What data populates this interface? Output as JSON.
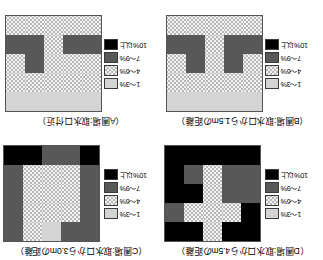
{
  "figure": {
    "orientation": "rotated-180",
    "rows": 5,
    "cols": 5
  },
  "legend": {
    "items": [
      {
        "label": "1〜3%",
        "category": "cat0",
        "swatch": "light-gray"
      },
      {
        "label": "4〜6%",
        "category": "cat1",
        "swatch": "checkered"
      },
      {
        "label": "7〜9%",
        "category": "cat2",
        "swatch": "dark-gray"
      },
      {
        "label": "10%以上",
        "category": "cat3",
        "swatch": "black"
      }
    ]
  },
  "panels": {
    "d": {
      "title": "（D圃場:取水口から4.5mの距離）",
      "id": "D"
    },
    "c": {
      "title": "（C圃場:取水口から3.0mの距離）",
      "id": "C"
    },
    "b": {
      "title": "（B圃場:取水口から1.5mの距離）",
      "id": "B"
    },
    "a": {
      "title": "（A圃場:取水口付近）",
      "id": "A"
    }
  },
  "chart_data": {
    "type": "heatmap",
    "xlabel": "",
    "ylabel": "",
    "grid": true,
    "legend_position": "left",
    "categories": [
      "1〜3%",
      "4〜6%",
      "7〜9%",
      "10%以上"
    ],
    "category_keys": [
      "cat0",
      "cat1",
      "cat2",
      "cat3"
    ],
    "colors": {
      "cat0": "#d4d4d4",
      "cat1": "#f2f2f2",
      "cat2": "#585858",
      "cat3": "#000000"
    },
    "panels": [
      {
        "id": "D",
        "title": "（D圃場:取水口から4.5mの距離）",
        "matrix": [
          [
            "cat3",
            "cat3",
            "cat1",
            "cat3",
            "cat3"
          ],
          [
            "cat3",
            "cat1",
            "cat1",
            "cat1",
            "cat2"
          ],
          [
            "cat2",
            "cat2",
            "cat1",
            "cat3",
            "cat3"
          ],
          [
            "cat2",
            "cat2",
            "cat1",
            "cat2",
            "cat3"
          ],
          [
            "cat3",
            "cat3",
            "cat3",
            "cat3",
            "cat3"
          ]
        ]
      },
      {
        "id": "C",
        "title": "（C圃場:取水口から3.0mの距離）",
        "matrix": [
          [
            "cat2",
            "cat2",
            "cat0",
            "cat1",
            "cat2"
          ],
          [
            "cat2",
            "cat1",
            "cat1",
            "cat1",
            "cat2"
          ],
          [
            "cat2",
            "cat1",
            "cat1",
            "cat1",
            "cat2"
          ],
          [
            "cat2",
            "cat1",
            "cat1",
            "cat1",
            "cat2"
          ],
          [
            "cat3",
            "cat2",
            "cat2",
            "cat3",
            "cat3"
          ]
        ]
      },
      {
        "id": "B",
        "title": "（B圃場:取水口から1.5mの距離）",
        "matrix": [
          [
            "cat0",
            "cat0",
            "cat0",
            "cat0",
            "cat0"
          ],
          [
            "cat1",
            "cat1",
            "cat1",
            "cat1",
            "cat1"
          ],
          [
            "cat1",
            "cat2",
            "cat1",
            "cat2",
            "cat1"
          ],
          [
            "cat2",
            "cat2",
            "cat1",
            "cat2",
            "cat2"
          ],
          [
            "cat1",
            "cat1",
            "cat1",
            "cat1",
            "cat1"
          ]
        ]
      },
      {
        "id": "A",
        "title": "（A圃場:取水口付近）",
        "matrix": [
          [
            "cat0",
            "cat0",
            "cat0",
            "cat0",
            "cat0"
          ],
          [
            "cat1",
            "cat1",
            "cat1",
            "cat1",
            "cat1"
          ],
          [
            "cat1",
            "cat1",
            "cat1",
            "cat2",
            "cat1"
          ],
          [
            "cat2",
            "cat2",
            "cat1",
            "cat2",
            "cat2"
          ],
          [
            "cat1",
            "cat1",
            "cat1",
            "cat1",
            "cat1"
          ]
        ]
      }
    ]
  }
}
